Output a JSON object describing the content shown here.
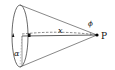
{
  "diagram": {
    "labels": {
      "apex": "P",
      "distance": "x",
      "apex_angle": "ϕ",
      "base_angle": "α"
    },
    "colors": {
      "stroke": "#333333",
      "point": "#000000",
      "background": "#ffffff"
    }
  }
}
